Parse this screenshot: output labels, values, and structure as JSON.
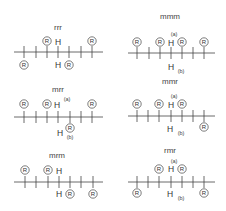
{
  "figure": {
    "substituent_label": "R",
    "proton_label": "H",
    "proton_sub_a": "(a)",
    "proton_sub_b": "(b)",
    "panels": [
      {
        "id": "rrr",
        "title": "rrr",
        "r_positions": [
          "down",
          "up",
          "down",
          "up"
        ],
        "h_labels": {
          "top": "H",
          "bottom": "H"
        },
        "h_subscripts": false
      },
      {
        "id": "mmm",
        "title": "mmm",
        "r_positions": [
          "up",
          "up",
          "up",
          "up"
        ],
        "h_labels": {
          "top": "H",
          "bottom": "H"
        },
        "h_subscripts": true
      },
      {
        "id": "mrr",
        "title": "mrr",
        "r_positions": [
          "up",
          "up",
          "down",
          "up"
        ],
        "h_labels": {
          "top": "H",
          "bottom": "H"
        },
        "h_subscripts": true
      },
      {
        "id": "mmr",
        "title": "mmr",
        "r_positions": [
          "up",
          "up",
          "up",
          "down"
        ],
        "h_labels": {
          "top": "H",
          "bottom": "H"
        },
        "h_subscripts": true
      },
      {
        "id": "mrm",
        "title": "mrm",
        "r_positions": [
          "up",
          "up",
          "down",
          "down"
        ],
        "h_labels": {
          "top": "H",
          "bottom": "H"
        },
        "h_subscripts": false
      },
      {
        "id": "rmr",
        "title": "rmr",
        "r_positions": [
          "down",
          "up",
          "up",
          "down"
        ],
        "h_labels": {
          "top": "H",
          "bottom": "H"
        },
        "h_subscripts": true
      }
    ]
  }
}
